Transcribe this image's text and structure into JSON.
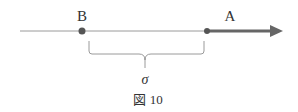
{
  "diagram": {
    "point_b_label": "B",
    "point_a_label": "A",
    "brace_label": "σ",
    "caption": "図 10",
    "colors": {
      "line": "#8a8a8a",
      "point": "#555555",
      "arrow": "#666666",
      "brace": "#9a9a9a",
      "text": "#333333"
    }
  }
}
